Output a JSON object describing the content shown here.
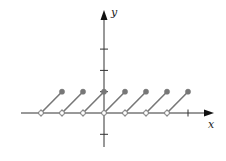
{
  "chart_data": {
    "type": "line",
    "title": "",
    "xlabel": "x",
    "ylabel": "y",
    "xlim": [
      -4,
      5
    ],
    "ylim": [
      -1,
      4
    ],
    "grid": false,
    "x_ticks": [
      -3,
      -2,
      -1,
      1,
      2,
      3,
      4
    ],
    "y_ticks": [
      -1,
      1,
      2,
      3
    ],
    "series": [
      {
        "name": "sawtooth",
        "segments": [
          {
            "start": [
              -3,
              0
            ],
            "end": [
              -2,
              1
            ],
            "start_open": true,
            "end_closed": true
          },
          {
            "start": [
              -2,
              0
            ],
            "end": [
              -1,
              1
            ],
            "start_open": true,
            "end_closed": true
          },
          {
            "start": [
              -1,
              0
            ],
            "end": [
              0,
              1
            ],
            "start_open": true,
            "end_closed": true
          },
          {
            "start": [
              0,
              0
            ],
            "end": [
              1,
              1
            ],
            "start_open": true,
            "end_closed": true
          },
          {
            "start": [
              1,
              0
            ],
            "end": [
              2,
              1
            ],
            "start_open": true,
            "end_closed": true
          },
          {
            "start": [
              2,
              0
            ],
            "end": [
              3,
              1
            ],
            "start_open": true,
            "end_closed": true
          },
          {
            "start": [
              3,
              0
            ],
            "end": [
              4,
              1
            ],
            "start_open": true,
            "end_closed": true
          }
        ]
      }
    ],
    "colors": {
      "axis": "#333333",
      "segment": "#777777",
      "dot_fill": "#777777",
      "open_fill": "#ffffff"
    }
  }
}
